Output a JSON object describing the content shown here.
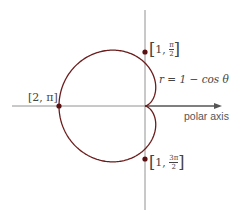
{
  "diagram": {
    "type": "polar cardioid",
    "equation_label": "r = 1 − cos θ",
    "axis_label": "polar axis",
    "points": [
      {
        "label": "[2, π]",
        "r": "2",
        "theta": "π"
      },
      {
        "label": "[1, π/2]",
        "r": "1",
        "theta_num": "π",
        "theta_den": "2"
      },
      {
        "label": "[1, 3π/2]",
        "r": "1",
        "theta_num": "3π",
        "theta_den": "2"
      }
    ],
    "colors": {
      "curve": "#6b1c1c",
      "points": "#5a1010",
      "axes": "#777777"
    }
  }
}
